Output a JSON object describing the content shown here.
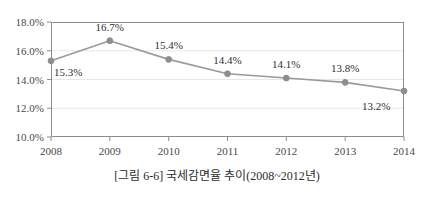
{
  "caption": "[그림 6-6] 국세감면율 추이(2008~2012년)",
  "colors": {
    "line": "#9a9a9a",
    "marker": "#8e8e8e",
    "gridline": "#e8e8e8",
    "axis": "#8c8c8c",
    "text": "#3a3a3a",
    "background": "#ffffff"
  },
  "chart_data": {
    "type": "line",
    "title": "",
    "xlabel": "",
    "ylabel": "",
    "categories": [
      "2008",
      "2009",
      "2010",
      "2011",
      "2012",
      "2013",
      "2014"
    ],
    "x": [
      2008,
      2009,
      2010,
      2011,
      2012,
      2013,
      2014
    ],
    "values": [
      15.3,
      16.7,
      15.4,
      14.4,
      14.1,
      13.8,
      13.2
    ],
    "point_labels": [
      "15.3%",
      "16.7%",
      "15.4%",
      "14.4%",
      "14.1%",
      "13.8%",
      "13.2%"
    ],
    "label_positions": [
      "below-right",
      "above",
      "above",
      "above",
      "above",
      "above",
      "below-left"
    ],
    "ylim": [
      10.0,
      18.0
    ],
    "yticks": [
      10.0,
      12.0,
      14.0,
      16.0,
      18.0
    ],
    "ytick_labels": [
      "10.0%",
      "12.0%",
      "14.0%",
      "16.0%",
      "18.0%"
    ],
    "xtick_labels": [
      "2008",
      "2009",
      "2010",
      "2011",
      "2012",
      "2013",
      "2014"
    ],
    "grid": true,
    "legend": "none",
    "series": [
      {
        "name": "국세감면율",
        "values": [
          15.3,
          16.7,
          15.4,
          14.4,
          14.1,
          13.8,
          13.2
        ]
      }
    ]
  }
}
